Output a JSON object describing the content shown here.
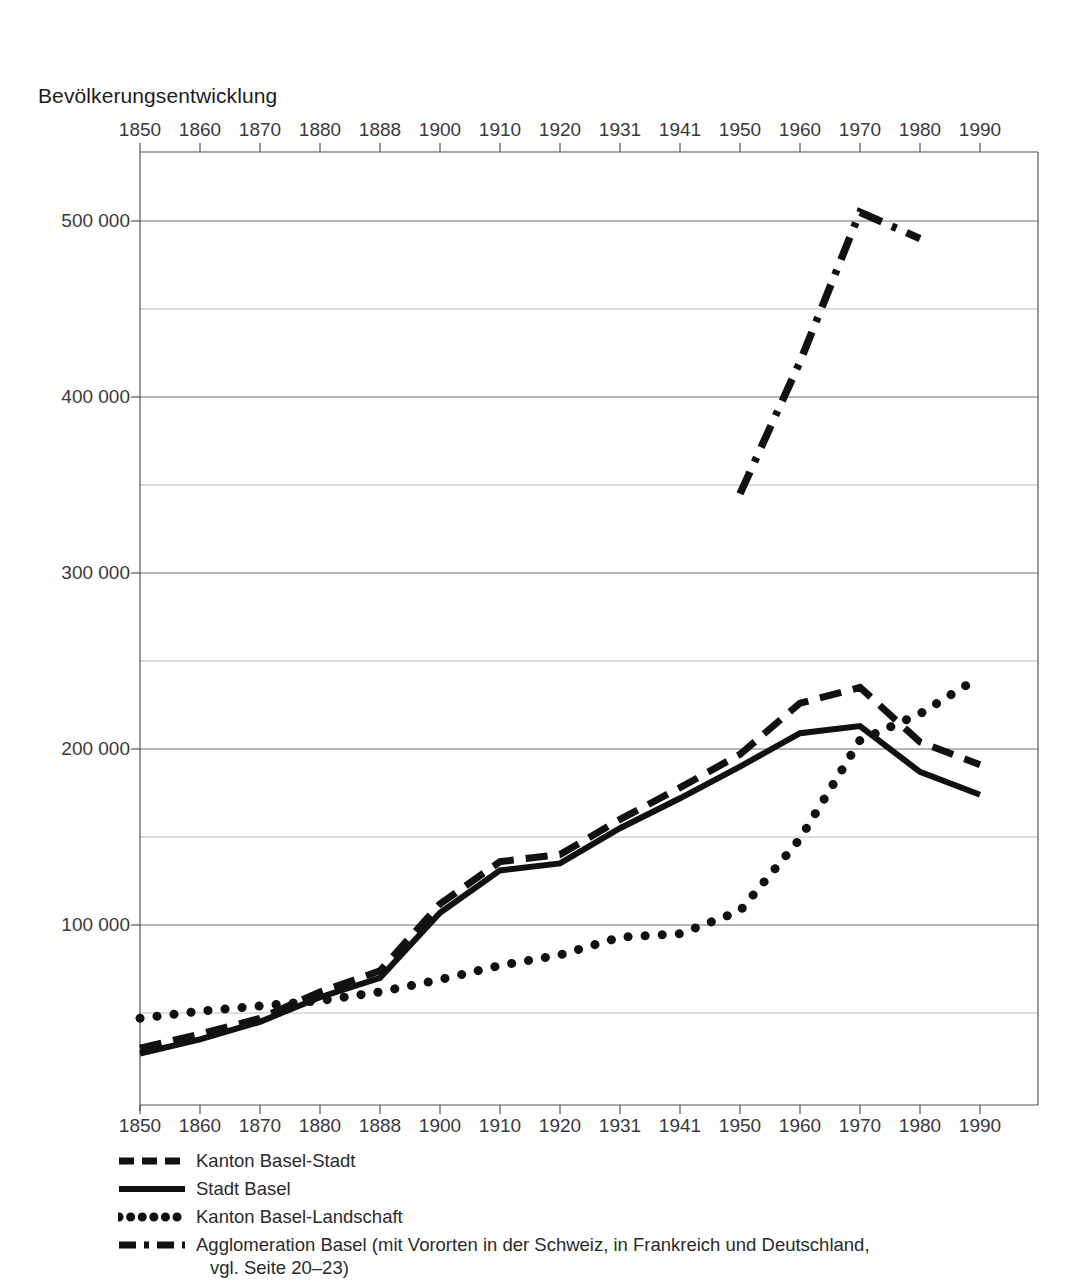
{
  "chart_data": {
    "type": "line",
    "title": "Bevölkerungsentwicklung",
    "xlabel": "",
    "ylabel": "",
    "grid": true,
    "legend_position": "below",
    "categories": [
      "1850",
      "1860",
      "1870",
      "1880",
      "1888",
      "1900",
      "1910",
      "1920",
      "1931",
      "1941",
      "1950",
      "1960",
      "1970",
      "1980",
      "1990"
    ],
    "x_tick_labels": [
      "1850",
      "1860",
      "1870",
      "1880",
      "1888",
      "1900",
      "1910",
      "1920",
      "1931",
      "1941",
      "1950",
      "1960",
      "1970",
      "1980",
      "1990"
    ],
    "y_tick_labels": [
      "100 000",
      "200 000",
      "300 000",
      "400 000",
      "500 000"
    ],
    "y_major_ticks": [
      100000,
      200000,
      300000,
      400000,
      500000
    ],
    "y_minor_ticks": [
      50000,
      150000,
      250000,
      350000,
      450000
    ],
    "ylim": [
      0,
      540000
    ],
    "series": [
      {
        "name": "Kanton Basel-Stadt",
        "style": "dashed",
        "color": "#111111",
        "x": [
          "1850",
          "1860",
          "1870",
          "1880",
          "1888",
          "1900",
          "1910",
          "1920",
          "1931",
          "1941",
          "1950",
          "1960",
          "1970",
          "1980",
          "1990"
        ],
        "values": [
          30000,
          38000,
          47000,
          62000,
          74000,
          112000,
          136000,
          140000,
          160000,
          178000,
          197000,
          226000,
          235000,
          204000,
          191000
        ]
      },
      {
        "name": "Stadt Basel",
        "style": "solid",
        "color": "#111111",
        "x": [
          "1850",
          "1860",
          "1870",
          "1880",
          "1888",
          "1900",
          "1910",
          "1920",
          "1931",
          "1941",
          "1950",
          "1960",
          "1970",
          "1980",
          "1990"
        ],
        "values": [
          27000,
          35000,
          45000,
          59000,
          70000,
          107000,
          131000,
          135000,
          155000,
          172000,
          190000,
          209000,
          213000,
          187000,
          174000
        ]
      },
      {
        "name": "Kanton Basel-Landschaft",
        "style": "dotted",
        "color": "#111111",
        "x": [
          "1850",
          "1860",
          "1870",
          "1880",
          "1888",
          "1900",
          "1910",
          "1920",
          "1931",
          "1941",
          "1950",
          "1960",
          "1970",
          "1980",
          "1990"
        ],
        "values": [
          47000,
          51000,
          54000,
          57000,
          62000,
          69000,
          77000,
          83000,
          93000,
          95000,
          108000,
          149000,
          205000,
          220000,
          241000
        ]
      },
      {
        "name": "Agglomeration Basel (mit Vororten in der Schweiz, in Frankreich und Deutschland, vgl. Seite 20–23)",
        "style": "dashdot",
        "color": "#111111",
        "x": [
          "1950",
          "1960",
          "1970",
          "1980"
        ],
        "values": [
          345000,
          420000,
          505000,
          490000
        ]
      }
    ]
  },
  "legend": {
    "items": [
      {
        "label": "Kanton Basel-Stadt",
        "label_line2": ""
      },
      {
        "label": "Stadt Basel",
        "label_line2": ""
      },
      {
        "label": "Kanton Basel-Landschaft",
        "label_line2": ""
      },
      {
        "label": "Agglomeration Basel (mit Vororten in der Schweiz, in Frankreich und Deutschland,",
        "label_line2": "vgl. Seite 20–23)"
      }
    ]
  }
}
